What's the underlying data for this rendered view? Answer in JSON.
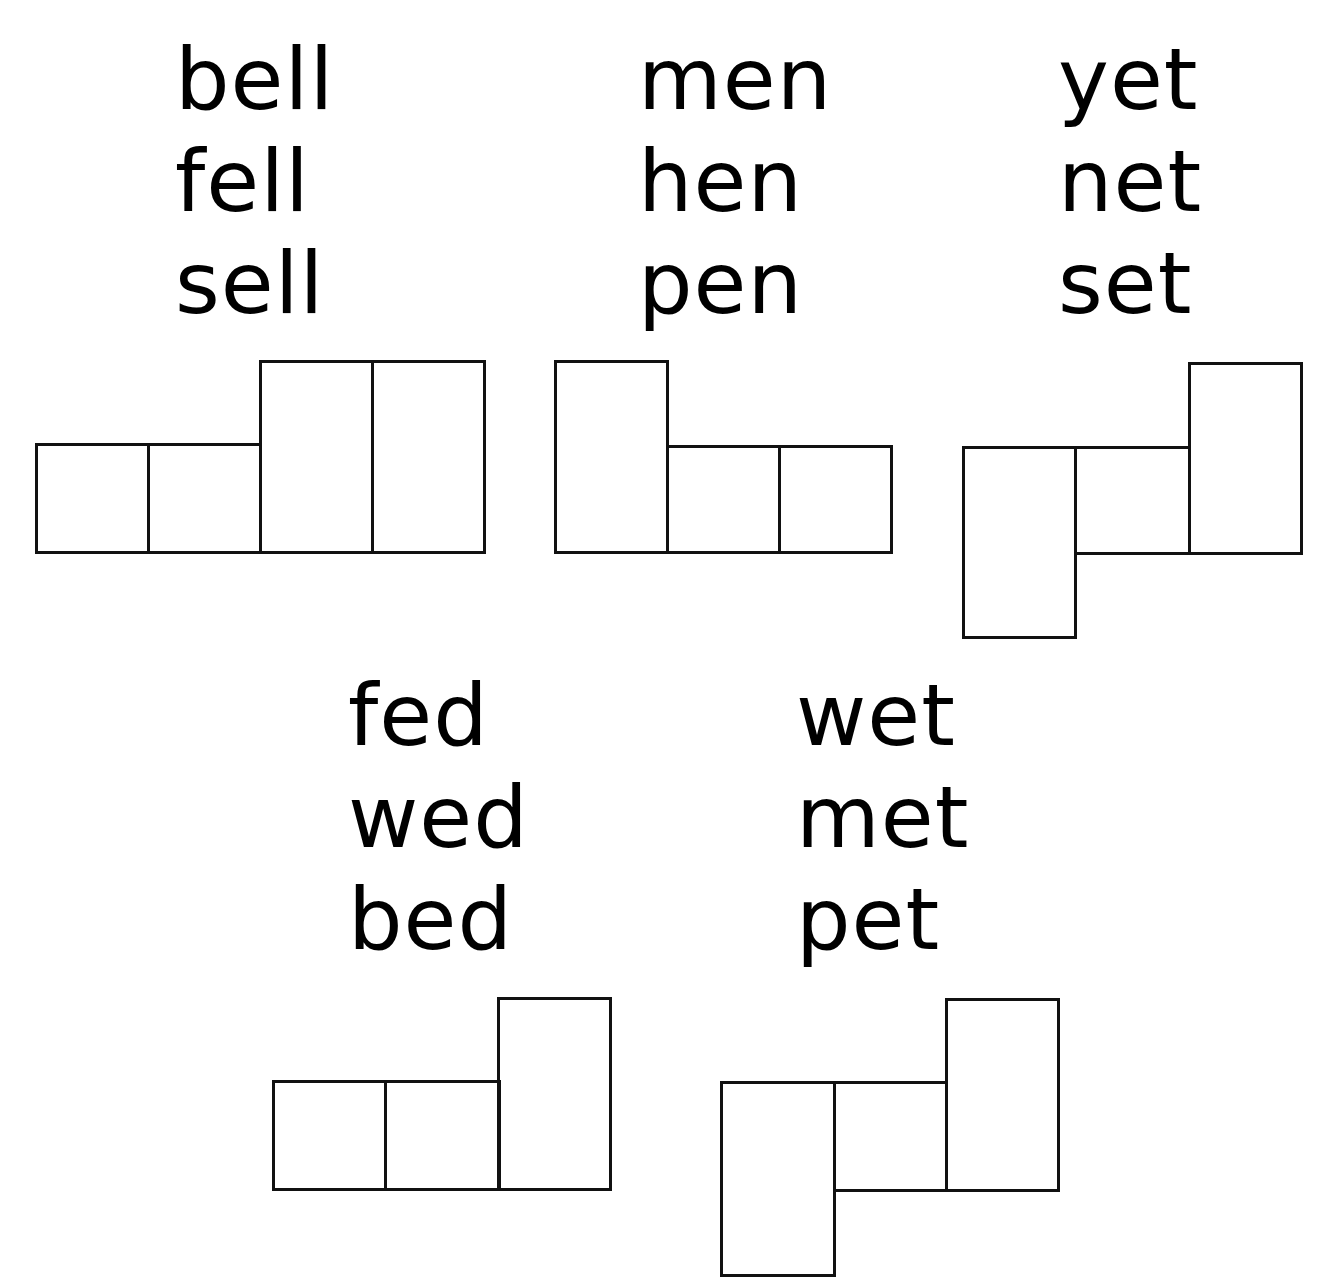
{
  "groups": [
    {
      "words": [
        "bell",
        "fell",
        "sell"
      ],
      "shape": "2 short boxes + 2 tall boxes"
    },
    {
      "words": [
        "men",
        "hen",
        "pen"
      ],
      "shape": "1 tall box + 2 short boxes"
    },
    {
      "words": [
        "yet",
        "net",
        "set"
      ],
      "shape": "1 descender box + 1 short box + 1 tall box"
    },
    {
      "words": [
        "fed",
        "wed",
        "bed"
      ],
      "shape": "2 short boxes + 1 tall box"
    },
    {
      "words": [
        "wet",
        "met",
        "pet"
      ],
      "shape": "1 descender box + 1 short box + 1 tall box"
    }
  ]
}
